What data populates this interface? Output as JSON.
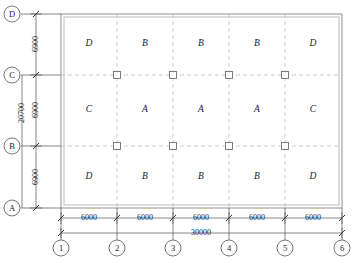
{
  "drawing": {
    "title": "Reinforced concrete floor slab framing plan",
    "units_note": "mm",
    "caption": "",
    "colors": {
      "ink": "#1a1a1a",
      "slab_outline": "#8a8a8a",
      "grid_dashed": "#b0b0b0",
      "dimension_line": "#555555",
      "column_marker": "#6e6e6e",
      "background": "#ffffff"
    },
    "slab": {
      "overall_width_label": "30000",
      "overall_height_label": "20700",
      "bay_count_x": 5,
      "bay_count_y": 3
    },
    "grid_letters": [
      "D",
      "C",
      "B",
      "A"
    ],
    "grid_numbers": [
      "1",
      "2",
      "3",
      "4",
      "5",
      "6"
    ],
    "vertical_dimensions": [
      "6900",
      "6900",
      "6900"
    ],
    "vertical_total": "20700",
    "horizontal_dimensions": [
      "6000",
      "6000",
      "6000",
      "6000",
      "6000"
    ],
    "horizontal_total": "30000",
    "panel_rows": [
      {
        "row_grid": "C-D",
        "panels": [
          "D",
          "B",
          "B",
          "B",
          "D"
        ]
      },
      {
        "row_grid": "B-C",
        "panels": [
          "C",
          "A",
          "A",
          "A",
          "C"
        ]
      },
      {
        "row_grid": "A-B",
        "panels": [
          "D",
          "B",
          "B",
          "B",
          "D"
        ]
      }
    ],
    "column_markers": {
      "symbol": "square",
      "rows": [
        "C",
        "B"
      ],
      "columns": [
        "2",
        "3",
        "4",
        "5"
      ],
      "count": 8
    }
  }
}
